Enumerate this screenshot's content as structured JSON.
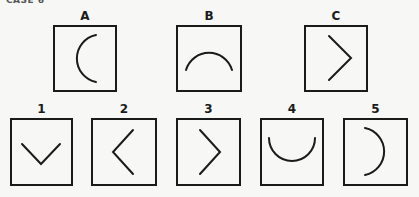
{
  "header": {
    "text": "CASE 6"
  },
  "stimulus_row": [
    {
      "label": "A",
      "figure": "arc-opening-right"
    },
    {
      "label": "B",
      "figure": "arc-opening-down"
    },
    {
      "label": "C",
      "figure": "chevron-pointing-right"
    }
  ],
  "answer_row": [
    {
      "label": "1",
      "figure": "chevron-pointing-down"
    },
    {
      "label": "2",
      "figure": "chevron-pointing-left"
    },
    {
      "label": "3",
      "figure": "chevron-pointing-right"
    },
    {
      "label": "4",
      "figure": "arc-opening-up"
    },
    {
      "label": "5",
      "figure": "arc-opening-left"
    }
  ],
  "colors": {
    "stroke": "#1a1a1a",
    "background": "#f7f7f5"
  }
}
